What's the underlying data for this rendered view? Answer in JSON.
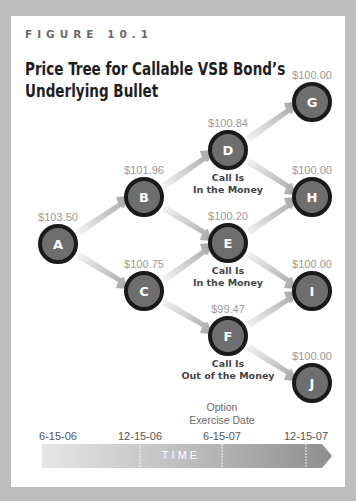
{
  "figure": {
    "label": "FIGURE 10.1",
    "title_line1": "Price Tree for Callable VSB Bond’s",
    "title_line2": "Underlying Bullet"
  },
  "nodes": [
    {
      "id": "A",
      "price": "$103.50"
    },
    {
      "id": "B",
      "price": "$101.96"
    },
    {
      "id": "C",
      "price": "$100.75"
    },
    {
      "id": "D",
      "price": "$100.84",
      "note1": "Call Is",
      "note2": "In the Money"
    },
    {
      "id": "E",
      "price": "$100.20",
      "note1": "Call Is",
      "note2": "In the Money"
    },
    {
      "id": "F",
      "price": "$99.47",
      "note1": "Call Is",
      "note2": "Out of the Money"
    },
    {
      "id": "G",
      "price": "$100.00"
    },
    {
      "id": "H",
      "price": "$100.00"
    },
    {
      "id": "I",
      "price": "$100.00"
    },
    {
      "id": "J",
      "price": "$100.00"
    }
  ],
  "edges": [
    [
      "A",
      "B"
    ],
    [
      "A",
      "C"
    ],
    [
      "B",
      "D"
    ],
    [
      "B",
      "E"
    ],
    [
      "C",
      "E"
    ],
    [
      "C",
      "F"
    ],
    [
      "D",
      "G"
    ],
    [
      "D",
      "H"
    ],
    [
      "E",
      "H"
    ],
    [
      "E",
      "I"
    ],
    [
      "F",
      "I"
    ],
    [
      "F",
      "J"
    ]
  ],
  "annotation": {
    "line1": "Option",
    "line2": "Exercise Date"
  },
  "timeline": {
    "dates": [
      "6-15-06",
      "12-15-06",
      "6-15-07",
      "12-15-07"
    ],
    "label": "TIME"
  },
  "colors": {
    "node_fill": "#6e6e6e",
    "node_stroke": "#1a1a1a",
    "arrow_light": "#f2f2f2",
    "arrow_dark": "#a8a8a8",
    "frame": "#bdbdbd"
  }
}
